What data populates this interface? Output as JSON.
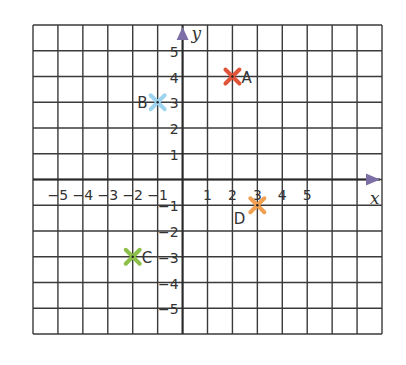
{
  "chart_data": {
    "type": "scatter",
    "title": "",
    "xlabel": "x",
    "ylabel": "y",
    "xlim": [
      -6,
      8
    ],
    "ylim": [
      -6,
      6
    ],
    "grid": true,
    "x_ticks": [
      "-5",
      "-4",
      "-3",
      "-2",
      "-1",
      "1",
      "2",
      "3",
      "4",
      "5"
    ],
    "y_ticks": [
      "5",
      "4",
      "3",
      "2",
      "1",
      "-1",
      "-2",
      "-3",
      "-4",
      "-5"
    ],
    "points": [
      {
        "label": "A",
        "x": 2,
        "y": 4,
        "color": "#e0553a",
        "label_pos": "right"
      },
      {
        "label": "B",
        "x": -1,
        "y": 3,
        "color": "#9fd4f0",
        "label_pos": "left"
      },
      {
        "label": "C",
        "x": -2,
        "y": -3,
        "color": "#8dc04a",
        "label_pos": "right"
      },
      {
        "label": "D",
        "x": 3,
        "y": -1,
        "color": "#f0a050",
        "label_pos": "below-left"
      }
    ]
  },
  "style": {
    "grid_color": "#3a3a3a",
    "axis_color": "#2a2a2a",
    "arrow_color": "#7b6fa6"
  }
}
